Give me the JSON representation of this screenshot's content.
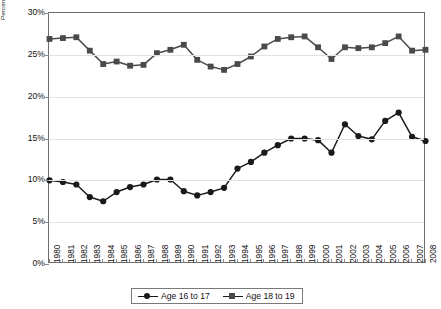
{
  "chart_data": {
    "type": "line",
    "title": "",
    "xlabel": "",
    "ylabel": "Percent of GED Test Takers",
    "ylim": [
      0,
      30
    ],
    "yticks": [
      "0%",
      "5%",
      "10%",
      "15%",
      "20%",
      "25%",
      "30%"
    ],
    "ytick_values": [
      0,
      5,
      10,
      15,
      20,
      25,
      30
    ],
    "grid": true,
    "legend_position": "bottom",
    "categories": [
      "1980",
      "1981",
      "1982",
      "1983",
      "1984",
      "1985",
      "1986",
      "1987",
      "1988",
      "1989",
      "1990",
      "1991",
      "1992",
      "1993",
      "1994",
      "1995",
      "1996",
      "1997",
      "1998",
      "1999",
      "2000",
      "2001",
      "2002",
      "2003",
      "2004",
      "2005",
      "2006",
      "2007",
      "2008"
    ],
    "series": [
      {
        "name": "Age 16 to 17",
        "marker": "circle",
        "color": "#1a1a1a",
        "values": [
          10.0,
          9.8,
          9.5,
          8.0,
          7.5,
          8.6,
          9.2,
          9.5,
          10.1,
          10.1,
          8.7,
          8.2,
          8.6,
          9.1,
          11.4,
          12.2,
          13.3,
          14.2,
          15.0,
          15.0,
          14.8,
          13.3,
          16.7,
          15.3,
          14.9,
          17.1,
          18.1,
          15.2,
          14.7
        ]
      },
      {
        "name": "Age 18 to 19",
        "marker": "square",
        "color": "#4a4a4a",
        "values": [
          26.9,
          27.0,
          27.1,
          25.5,
          23.9,
          24.2,
          23.7,
          23.8,
          25.2,
          25.6,
          26.2,
          24.4,
          23.6,
          23.2,
          23.9,
          24.8,
          26.0,
          26.9,
          27.1,
          27.2,
          25.9,
          24.5,
          25.9,
          25.8,
          25.9,
          26.4,
          27.2,
          25.5,
          25.6
        ]
      }
    ]
  },
  "legend": {
    "items": [
      {
        "label": "Age 16 to 17"
      },
      {
        "label": "Age 18 to 19"
      }
    ]
  }
}
